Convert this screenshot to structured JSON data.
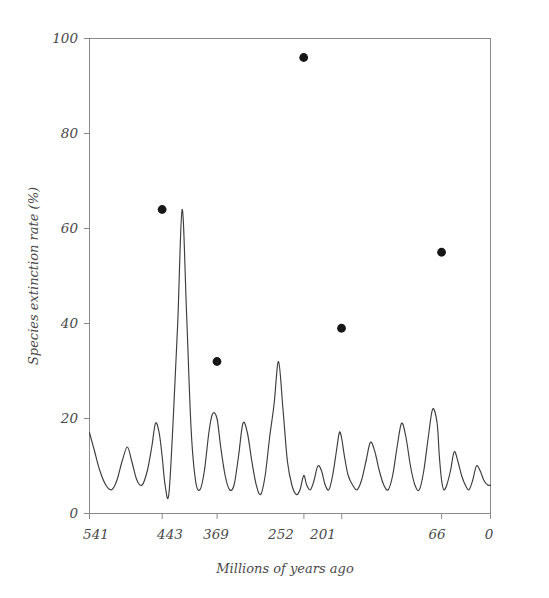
{
  "chart_data": {
    "type": "line",
    "title": "",
    "xlabel": "Millions of years ago",
    "ylabel": "Species extinction rate (%)",
    "xlim": [
      541,
      0
    ],
    "ylim": [
      0,
      100
    ],
    "x_reversed": true,
    "grid": false,
    "legend": "none",
    "xticks": [
      541,
      443,
      369,
      252,
      201,
      66,
      0
    ],
    "xtick_labels": [
      "541",
      "443",
      "369",
      "252",
      "201",
      "66",
      "0"
    ],
    "yticks": [
      0,
      20,
      40,
      60,
      80,
      100
    ],
    "ytick_labels": [
      "0",
      "20",
      "40",
      "60",
      "80",
      "100"
    ],
    "series": [
      {
        "name": "Species extinction rate",
        "x": [
          541,
          534,
          527,
          519,
          511,
          504,
          497,
          490,
          484,
          477,
          470,
          463,
          457,
          452,
          447,
          443,
          439,
          434,
          428,
          422,
          416,
          410,
          404,
          398,
          392,
          386,
          380,
          375,
          369,
          364,
          358,
          352,
          346,
          340,
          334,
          328,
          322,
          316,
          310,
          304,
          298,
          292,
          286,
          280,
          274,
          268,
          262,
          257,
          252,
          248,
          243,
          238,
          233,
          228,
          223,
          218,
          213,
          208,
          204,
          201,
          197,
          192,
          186,
          180,
          174,
          168,
          162,
          156,
          150,
          144,
          138,
          132,
          126,
          120,
          114,
          108,
          102,
          96,
          90,
          84,
          78,
          72,
          69,
          66,
          63,
          59,
          54,
          49,
          44,
          39,
          34,
          29,
          24,
          19,
          14,
          9,
          4,
          0
        ],
        "y": [
          17,
          13,
          9,
          6,
          5,
          7,
          11,
          14,
          11,
          7,
          6,
          9,
          14,
          19,
          17,
          12,
          6,
          4,
          20,
          40,
          64,
          42,
          18,
          7,
          5,
          9,
          17,
          21,
          20,
          14,
          8,
          5,
          6,
          12,
          19,
          17,
          11,
          6,
          4,
          8,
          16,
          23,
          32,
          22,
          11,
          6,
          4,
          5,
          8,
          6,
          5,
          7,
          10,
          9,
          6,
          5,
          8,
          13,
          17,
          16,
          12,
          8,
          6,
          5,
          7,
          11,
          15,
          13,
          9,
          6,
          5,
          8,
          14,
          19,
          16,
          10,
          6,
          5,
          9,
          16,
          22,
          19,
          12,
          7,
          5,
          6,
          9,
          13,
          11,
          8,
          6,
          5,
          7,
          10,
          9,
          7,
          6,
          6
        ],
        "color": "#3c3c3c"
      }
    ],
    "annotated_points": [
      {
        "label": "Late Ordovician",
        "x": 443,
        "y": 64
      },
      {
        "label": "Late Devonian",
        "x": 369,
        "y": 32
      },
      {
        "label": "End-Permian",
        "x": 252,
        "y": 96
      },
      {
        "label": "End-Triassic",
        "x": 201,
        "y": 39
      },
      {
        "label": "End-Cretaceous",
        "x": 66,
        "y": 55
      }
    ],
    "colors": {
      "curve": "#3c3c3c",
      "marker": "#161616",
      "frame": "#8a8a8a",
      "text": "#4a4a4a",
      "background": "#ffffff"
    }
  }
}
